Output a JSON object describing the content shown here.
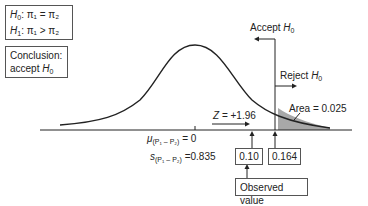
{
  "hypotheses": {
    "h0": {
      "symbol": "H",
      "sub": "0",
      "expr": ": π₁ = π₂"
    },
    "h1": {
      "symbol": "H",
      "sub": "1",
      "expr": ": π₁ > π₂"
    }
  },
  "conclusion": {
    "line1": "Conclusion:",
    "line2": "accept ",
    "symbol": "H",
    "sub": "0"
  },
  "regions": {
    "accept": {
      "text": "Accept ",
      "symbol": "H",
      "sub": "0"
    },
    "reject": {
      "text": "Reject ",
      "symbol": "H",
      "sub": "0"
    }
  },
  "area_label": "Area = 0.025",
  "z_label": {
    "symbol": "Z",
    "value": " = +1.96"
  },
  "mean_label": {
    "symbol": "μ",
    "sub": "(P₁ – P₂)",
    "value": " = 0"
  },
  "sd_label": {
    "symbol": "s",
    "sub": "(P₁ – P₂)",
    "value": " =0.835"
  },
  "observed_box": "0.10",
  "critical_box": "0.164",
  "observed_value_label": "Observed value",
  "colors": {
    "line": "#222222",
    "shade": "#a8a8a8",
    "border": "#555555"
  }
}
